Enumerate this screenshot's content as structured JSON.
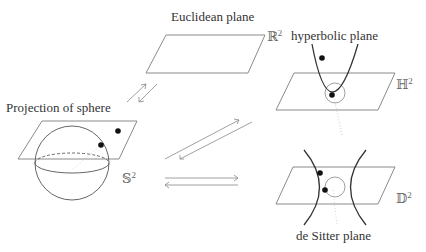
{
  "labels": {
    "euclidean": "Euclidean plane",
    "hyperbolic": "hyperbolic plane",
    "sphere": "Projection of sphere",
    "de_sitter": "de Sitter plane"
  },
  "symbols": {
    "R": "ℝ",
    "H": "ℍ",
    "S": "𝕊",
    "D": "𝔻",
    "exponent": "2"
  },
  "colors": {
    "plane_stroke": "#8a8a8a",
    "curve_stroke": "#333333",
    "point_fill": "#111111",
    "arrow_stroke": "#888888",
    "projection_dotted": "#bbbbbb"
  }
}
